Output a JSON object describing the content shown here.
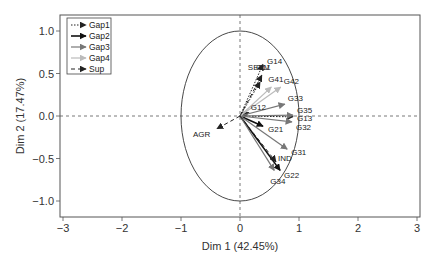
{
  "chart_data": {
    "type": "scatter",
    "subtype": "pca-variable-correlation-circle",
    "title": "",
    "xlabel": "Dim 1 (42.45%)",
    "ylabel": "Dim 2 (17.47%)",
    "xlim": [
      -3,
      3
    ],
    "ylim": [
      -1.2,
      1.2
    ],
    "x_ticks": [
      -3,
      -2,
      -1,
      0,
      1,
      2,
      3
    ],
    "x_tick_labels": [
      "−3",
      "−2",
      "−1",
      "0",
      "1",
      "2",
      "3"
    ],
    "y_ticks": [
      1.0,
      0.5,
      0.0,
      -0.5,
      -1.0
    ],
    "y_tick_labels": [
      "1.0",
      "0.5",
      "0.0",
      "−0.5",
      "−1.0"
    ],
    "grid": false,
    "reference_lines": {
      "x": 0,
      "y": 0,
      "style": "dashed"
    },
    "unit_circle": true,
    "legend_position": "top-left",
    "legend": [
      {
        "name": "Gap1",
        "color": "#222222",
        "dash": "1.5,1.5",
        "width": 1
      },
      {
        "name": "Gap2",
        "color": "#111111",
        "dash": "",
        "width": 1.6
      },
      {
        "name": "Gap3",
        "color": "#777777",
        "dash": "",
        "width": 1.2
      },
      {
        "name": "Gap4",
        "color": "#bbbbbb",
        "dash": "",
        "width": 1.2
      },
      {
        "name": "Sup",
        "color": "#222222",
        "dash": "4,3",
        "width": 1
      }
    ],
    "series": [
      {
        "name": "Gap1",
        "points": [
          {
            "label": "G11",
            "x": 0.34,
            "y": 0.4
          },
          {
            "label": "G12",
            "x": 0.15,
            "y": 0.04
          },
          {
            "label": "G13",
            "x": 0.9,
            "y": -0.01
          },
          {
            "label": "G14",
            "x": 0.39,
            "y": 0.61
          }
        ]
      },
      {
        "name": "Gap2",
        "points": [
          {
            "label": "G21",
            "x": 0.39,
            "y": -0.12
          },
          {
            "label": "G22",
            "x": 0.68,
            "y": -0.64
          }
        ]
      },
      {
        "name": "Gap3",
        "points": [
          {
            "label": "G31",
            "x": 0.8,
            "y": -0.39
          },
          {
            "label": "G32",
            "x": 0.88,
            "y": -0.07
          },
          {
            "label": "G33",
            "x": 0.76,
            "y": 0.14
          },
          {
            "label": "G34",
            "x": 0.58,
            "y": -0.64
          },
          {
            "label": "G35",
            "x": 0.9,
            "y": 0.01
          }
        ]
      },
      {
        "name": "Gap4",
        "points": [
          {
            "label": "G41",
            "x": 0.53,
            "y": 0.34
          },
          {
            "label": "G42",
            "x": 0.69,
            "y": 0.34
          }
        ]
      },
      {
        "name": "Sup",
        "points": [
          {
            "label": "AGR",
            "x": -0.39,
            "y": -0.15
          },
          {
            "label": "IND",
            "x": 0.61,
            "y": -0.54
          },
          {
            "label": "SERV",
            "x": 0.37,
            "y": 0.48
          }
        ]
      }
    ],
    "label_offsets": {
      "G11": [
        -4,
        -12
      ],
      "G12": [
        2,
        -3
      ],
      "G13": [
        4,
        4
      ],
      "G14": [
        4,
        0
      ],
      "G21": [
        5,
        6
      ],
      "G22": [
        4,
        8
      ],
      "G31": [
        4,
        6
      ],
      "G32": [
        4,
        8
      ],
      "G33": [
        3,
        -3
      ],
      "G34": [
        -4,
        14
      ],
      "G35": [
        4,
        -2
      ],
      "G41": [
        -3,
        -5
      ],
      "G42": [
        3,
        -3
      ],
      "AGR": [
        -24,
        8
      ],
      "IND": [
        2,
        -1
      ],
      "SERV": [
        -14,
        -5
      ]
    }
  }
}
